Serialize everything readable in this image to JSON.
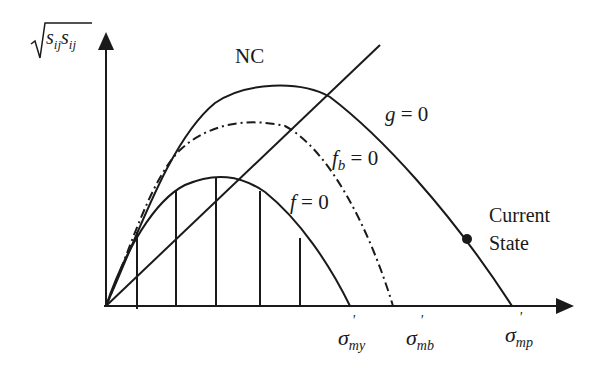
{
  "diagram": {
    "y_axis": {
      "label_base": "s",
      "label_sub": "ij",
      "label_full": "√(s_ij s_ij)"
    },
    "x_axis": {
      "ticks": [
        {
          "base": "σ",
          "prime": "'",
          "sub": "my"
        },
        {
          "base": "σ",
          "prime": "'",
          "sub": "mb"
        },
        {
          "base": "σ",
          "prime": "'",
          "sub": "mp"
        }
      ]
    },
    "labels": {
      "nc": "NC",
      "g_base": "g",
      "g_rest": " = 0",
      "fb_base": "f",
      "fb_sub": "b",
      "fb_rest": " = 0",
      "f_base": "f",
      "f_rest": " = 0",
      "current_state_line1": "Current",
      "current_state_line2": "State"
    },
    "colors": {
      "line": "#1a1a1a",
      "background": "#ffffff"
    }
  }
}
